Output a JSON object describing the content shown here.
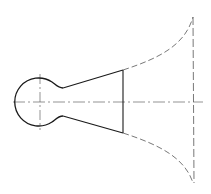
{
  "diagram": {
    "type": "technical-drawing",
    "colors": {
      "background": "#ffffff",
      "outline": "#1a1a1a",
      "hidden_line": "#555555",
      "center_line": "#666666"
    },
    "elements": [
      "circular-bulb",
      "neck",
      "conical-section",
      "section-line",
      "flared-bell-dashed",
      "bell-mouth-dashed",
      "horizontal-center-line",
      "vertical-center-line-bulb"
    ]
  }
}
